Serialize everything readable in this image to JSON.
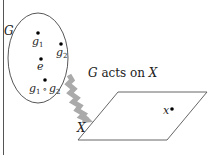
{
  "diagram": {
    "group_label": "G",
    "space_label": "X",
    "action_label_g": "G",
    "action_label_mid": " acts on ",
    "action_label_x": "X",
    "elements": [
      {
        "name": "g1",
        "base": "g",
        "sub": "1"
      },
      {
        "name": "g2",
        "base": "g",
        "sub": "2"
      },
      {
        "name": "e",
        "base": "e",
        "sub": ""
      }
    ],
    "product": {
      "left_base": "g",
      "left_sub": "1",
      "op": "∘",
      "right_base": "g",
      "right_sub": "2"
    },
    "point_label": "x",
    "colors": {
      "line": "#333333",
      "arrow": "#a8a8a8",
      "dot": "#000000"
    }
  }
}
